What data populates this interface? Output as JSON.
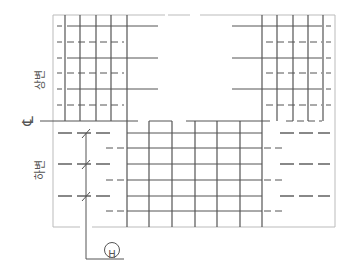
{
  "drawing": {
    "labels": {
      "upper_side": "상변",
      "lower_side": "하변",
      "centerline": "℄",
      "grid_marker": "H"
    },
    "colors": {
      "line": "#555555",
      "border": "#bbbbbb",
      "thick_bar": "#888888",
      "background": "#ffffff"
    }
  }
}
